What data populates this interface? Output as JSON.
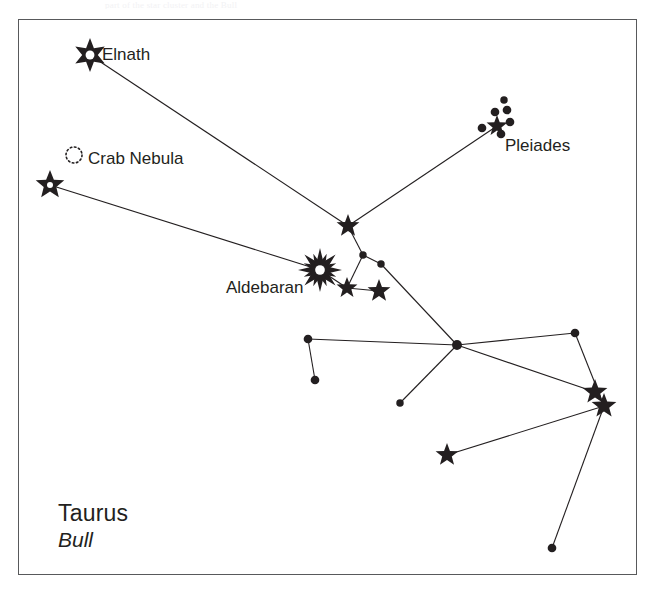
{
  "page": {
    "top_caption": "part of the star cluster and the Bull",
    "background_color": "#ffffff",
    "ink_color": "#231f20",
    "frame_color": "#58595b",
    "width": 655,
    "height": 592
  },
  "frame": {
    "x": 18,
    "y": 19,
    "width": 619,
    "height": 556
  },
  "labels": {
    "elnath": {
      "text": "Elnath",
      "x": 102,
      "y": 45
    },
    "crab_nebula": {
      "text": "Crab Nebula",
      "x": 88,
      "y": 149
    },
    "pleiades": {
      "text": "Pleiades",
      "x": 505,
      "y": 136
    },
    "aldebaran": {
      "text": "Aldebaran",
      "x": 226,
      "y": 278
    },
    "constellation_name": {
      "text": "Taurus",
      "x": 58,
      "y": 500
    },
    "constellation_common": {
      "text": "Bull",
      "x": 58,
      "y": 528
    }
  },
  "chart_data": {
    "type": "scatter",
    "title": "Taurus",
    "subtitle": "Bull",
    "xlabel": "",
    "ylabel": "",
    "grid": false,
    "legend": "none",
    "xlim": [
      0,
      655
    ],
    "ylim": [
      0,
      592
    ],
    "nodes": [
      {
        "id": "elnath",
        "name": "Elnath",
        "x": 90,
        "y": 55,
        "symbol": "star-6-hollow-center",
        "size": 17
      },
      {
        "id": "zeta",
        "name": "",
        "x": 50,
        "y": 185,
        "symbol": "star-5-hollow-center",
        "size": 15
      },
      {
        "id": "crab",
        "name": "Crab Nebula",
        "x": 74,
        "y": 155,
        "symbol": "nebula-dotted-circle",
        "size": 8
      },
      {
        "id": "junction",
        "name": "",
        "x": 348,
        "y": 226,
        "symbol": "star-5",
        "size": 12
      },
      {
        "id": "aldebaran",
        "name": "Aldebaran",
        "x": 320,
        "y": 270,
        "symbol": "star-burst-8-hollow-center",
        "size": 22
      },
      {
        "id": "star-a",
        "name": "",
        "x": 347,
        "y": 288,
        "symbol": "star-5",
        "size": 11
      },
      {
        "id": "star-b",
        "name": "",
        "x": 379,
        "y": 291,
        "symbol": "star-5",
        "size": 12
      },
      {
        "id": "dot-a",
        "name": "",
        "x": 363,
        "y": 255,
        "symbol": "dot",
        "size": 6
      },
      {
        "id": "dot-b",
        "name": "",
        "x": 381,
        "y": 264,
        "symbol": "dot",
        "size": 6
      },
      {
        "id": "pleiades",
        "name": "Pleiades",
        "x": 497,
        "y": 126,
        "symbol": "star-5",
        "size": 11
      },
      {
        "id": "pl-1",
        "name": "",
        "x": 482,
        "y": 128,
        "symbol": "dot",
        "size": 7
      },
      {
        "id": "pl-2",
        "name": "",
        "x": 495,
        "y": 112,
        "symbol": "dot",
        "size": 7
      },
      {
        "id": "pl-3",
        "name": "",
        "x": 507,
        "y": 110,
        "symbol": "dot",
        "size": 7
      },
      {
        "id": "pl-4",
        "name": "",
        "x": 510,
        "y": 122,
        "symbol": "dot",
        "size": 7
      },
      {
        "id": "pl-5",
        "name": "",
        "x": 501,
        "y": 134,
        "symbol": "dot",
        "size": 7
      },
      {
        "id": "pl-6",
        "name": "",
        "x": 504,
        "y": 100,
        "symbol": "dot",
        "size": 6
      },
      {
        "id": "hub",
        "name": "",
        "x": 457,
        "y": 345,
        "symbol": "dot",
        "size": 8
      },
      {
        "id": "dot-c",
        "name": "",
        "x": 308,
        "y": 339,
        "symbol": "dot",
        "size": 7
      },
      {
        "id": "dot-d",
        "name": "",
        "x": 315,
        "y": 380,
        "symbol": "dot",
        "size": 7
      },
      {
        "id": "dot-e",
        "name": "",
        "x": 400,
        "y": 403,
        "symbol": "dot",
        "size": 6
      },
      {
        "id": "dot-f",
        "name": "",
        "x": 575,
        "y": 333,
        "symbol": "dot",
        "size": 7
      },
      {
        "id": "star-c",
        "name": "",
        "x": 595,
        "y": 392,
        "symbol": "star-5",
        "size": 13
      },
      {
        "id": "star-d",
        "name": "",
        "x": 604,
        "y": 406,
        "symbol": "star-5",
        "size": 13
      },
      {
        "id": "star-e",
        "name": "",
        "x": 447,
        "y": 455,
        "symbol": "star-5",
        "size": 12
      },
      {
        "id": "dot-g",
        "name": "",
        "x": 552,
        "y": 548,
        "symbol": "dot",
        "size": 7
      }
    ],
    "edges": [
      {
        "from": "elnath",
        "to": "junction"
      },
      {
        "from": "zeta",
        "to": "aldebaran"
      },
      {
        "from": "junction",
        "to": "pleiades"
      },
      {
        "from": "junction",
        "to": "dot-a"
      },
      {
        "from": "dot-a",
        "to": "dot-b"
      },
      {
        "from": "dot-a",
        "to": "star-a"
      },
      {
        "from": "aldebaran",
        "to": "star-a"
      },
      {
        "from": "star-a",
        "to": "star-b"
      },
      {
        "from": "dot-b",
        "to": "hub"
      },
      {
        "from": "hub",
        "to": "dot-c"
      },
      {
        "from": "dot-c",
        "to": "dot-d"
      },
      {
        "from": "hub",
        "to": "dot-e"
      },
      {
        "from": "hub",
        "to": "dot-f"
      },
      {
        "from": "dot-f",
        "to": "star-d"
      },
      {
        "from": "hub",
        "to": "star-c"
      },
      {
        "from": "star-d",
        "to": "star-e"
      },
      {
        "from": "star-d",
        "to": "dot-g"
      }
    ],
    "line_color": "#231f20",
    "line_width": 1.1
  }
}
